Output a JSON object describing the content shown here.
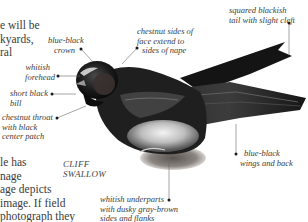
{
  "page": {
    "body_text_top": [
      "e will be",
      "kyards,",
      "ral"
    ],
    "body_text_bottom": [
      "le has",
      "nage",
      "age depicts",
      "image. If field",
      "photograph they"
    ]
  },
  "illustration": {
    "subject": "bird-photograph",
    "caption": [
      "CLIFF",
      "SWALLOW"
    ],
    "labels": {
      "crown": [
        "blue-black",
        "crown"
      ],
      "face": [
        "chestnut sides of",
        "face extend to",
        "sides of nape"
      ],
      "forehead": [
        "whitish",
        "forehead"
      ],
      "bill": [
        "short black",
        "bill"
      ],
      "throat": [
        "chestnut throat",
        "with black",
        "center patch"
      ],
      "tail": [
        "squared blackish",
        "tail with slight cleft"
      ],
      "wings": [
        "blue-black",
        "wings and back"
      ],
      "underparts": [
        "whitish underparts",
        "with dusky gray-brown",
        "sides and flanks"
      ]
    }
  }
}
